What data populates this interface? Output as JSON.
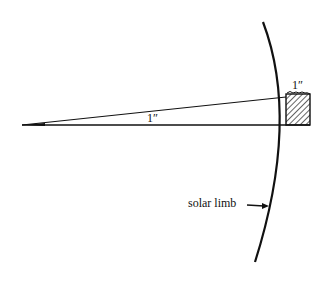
{
  "diagram": {
    "labels": {
      "angle_label": "1″",
      "box_label": "1″",
      "limb_label": "solar limb"
    },
    "colors": {
      "ink": "#111111",
      "background": "#ffffff"
    }
  }
}
